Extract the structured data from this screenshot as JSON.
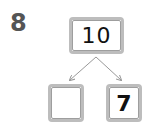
{
  "question": {
    "number": "8"
  },
  "number_bond": {
    "whole": "10",
    "parts": [
      "",
      "7"
    ]
  },
  "colors": {
    "box_border": "#bdbdbd",
    "arrow": "#999999",
    "question_number": "#555555"
  }
}
